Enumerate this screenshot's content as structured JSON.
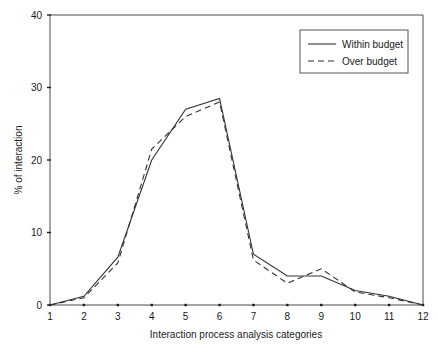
{
  "chart_data": {
    "type": "line",
    "title": "",
    "subtitle": "",
    "xlabel": "Interaction process analysis categories",
    "ylabel": "% of interaction",
    "categories": [
      "1",
      "2",
      "3",
      "4",
      "5",
      "6",
      "7",
      "8",
      "9",
      "10",
      "11",
      "12"
    ],
    "x": [
      1,
      2,
      3,
      4,
      5,
      6,
      7,
      8,
      9,
      10,
      11,
      12
    ],
    "xlim": [
      1,
      12
    ],
    "ylim": [
      0,
      40
    ],
    "xticks": [
      "1",
      "2",
      "3",
      "4",
      "5",
      "6",
      "7",
      "8",
      "9",
      "10",
      "11",
      "12"
    ],
    "yticks": [
      "0",
      "10",
      "20",
      "30",
      "40"
    ],
    "ytick_values": [
      0,
      10,
      20,
      30,
      40
    ],
    "grid": false,
    "legend_position": "top-right",
    "series": [
      {
        "name": "Within budget",
        "style": "solid",
        "color": "#333333",
        "values": [
          0,
          1.2,
          6.6,
          20.0,
          27.0,
          28.5,
          7.0,
          4.0,
          4.0,
          2.0,
          1.2,
          0
        ]
      },
      {
        "name": "Over budget",
        "style": "dashed",
        "color": "#333333",
        "values": [
          0,
          1.0,
          5.8,
          21.5,
          26.0,
          28.0,
          6.2,
          3.0,
          5.0,
          1.8,
          1.0,
          0
        ]
      }
    ]
  },
  "legend": {
    "entries": [
      {
        "label": "Within budget",
        "style": "solid"
      },
      {
        "label": "Over budget",
        "style": "dashed"
      }
    ]
  },
  "axes": {
    "y_label": "% of interaction",
    "x_label": "Interaction process analysis categories"
  }
}
